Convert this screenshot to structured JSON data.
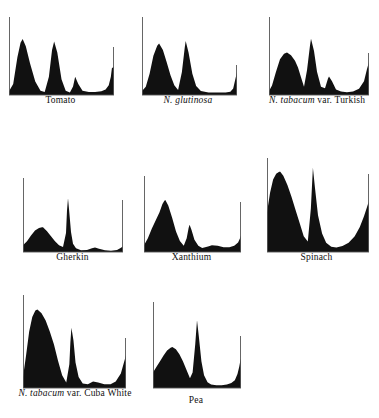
{
  "figure": {
    "type": "densitometer-trace-panel-grid",
    "panel_count": 8,
    "columns": 3,
    "rows": 3,
    "background_color": "#ffffff",
    "trace_color": "#111111",
    "axis_color": "#555555"
  },
  "chart_data": {
    "type": "area",
    "title": "",
    "subtitle": "",
    "xlabel": "",
    "ylabel": "",
    "grid": false,
    "legend_position": "none",
    "axis_ranges": {
      "x": [
        0,
        100
      ],
      "y": [
        0,
        100
      ]
    },
    "panels": [
      {
        "id": "tomato",
        "label": "Tomato",
        "label_italic_prefix": "",
        "label_roman_suffix": "Tomato",
        "peaks": [
          {
            "x": 13,
            "height": 92
          },
          {
            "x": 43,
            "height": 88
          },
          {
            "x": 63,
            "height": 30
          },
          {
            "x": 98,
            "height": 47
          }
        ],
        "x": [
          0,
          4,
          8,
          11,
          13,
          16,
          20,
          25,
          30,
          34,
          38,
          41,
          43,
          46,
          50,
          54,
          58,
          61,
          63,
          66,
          70,
          76,
          82,
          88,
          92,
          95,
          97,
          98,
          100
        ],
        "y": [
          6,
          18,
          62,
          86,
          92,
          80,
          52,
          22,
          7,
          5,
          30,
          74,
          88,
          70,
          26,
          7,
          4,
          14,
          30,
          18,
          7,
          5,
          5,
          6,
          9,
          16,
          30,
          44,
          47
        ]
      },
      {
        "id": "n-glutinosa",
        "label": "N. glutinosa",
        "label_italic_prefix": "N. glutinosa",
        "label_roman_suffix": "",
        "peaks": [
          {
            "x": 18,
            "height": 63
          },
          {
            "x": 46,
            "height": 66
          },
          {
            "x": 100,
            "height": 28
          }
        ],
        "x": [
          0,
          4,
          8,
          12,
          16,
          18,
          22,
          26,
          30,
          34,
          38,
          42,
          45,
          46,
          49,
          53,
          57,
          62,
          70,
          80,
          88,
          93,
          96,
          98,
          100
        ],
        "y": [
          5,
          10,
          26,
          48,
          60,
          63,
          55,
          40,
          24,
          12,
          6,
          28,
          58,
          66,
          52,
          26,
          11,
          5,
          3,
          3,
          3,
          4,
          8,
          18,
          28
        ]
      },
      {
        "id": "n-tabacum-turkish",
        "label": "N. tabacum var. Turkish",
        "label_italic_prefix": "N. tabacum",
        "label_roman_suffix": " var. Turkish",
        "peaks": [
          {
            "x": 18,
            "height": 62
          },
          {
            "x": 42,
            "height": 82
          },
          {
            "x": 60,
            "height": 27
          },
          {
            "x": 100,
            "height": 48
          }
        ],
        "x": [
          0,
          3,
          7,
          11,
          15,
          18,
          22,
          26,
          29,
          32,
          35,
          38,
          41,
          42,
          45,
          48,
          52,
          56,
          59,
          60,
          63,
          67,
          72,
          78,
          84,
          90,
          95,
          98,
          100
        ],
        "y": [
          6,
          14,
          34,
          52,
          60,
          62,
          58,
          50,
          40,
          26,
          12,
          36,
          72,
          82,
          64,
          34,
          12,
          10,
          24,
          27,
          20,
          8,
          5,
          4,
          5,
          9,
          20,
          38,
          48
        ]
      },
      {
        "id": "gherkin",
        "label": "Gherkin",
        "label_italic_prefix": "",
        "label_roman_suffix": "Gherkin",
        "peaks": [
          {
            "x": 20,
            "height": 60
          },
          {
            "x": 45,
            "height": 130
          },
          {
            "x": 72,
            "height": 11
          },
          {
            "x": 100,
            "height": 14
          }
        ],
        "x": [
          0,
          4,
          8,
          12,
          16,
          19,
          20,
          24,
          28,
          32,
          36,
          40,
          43,
          44,
          45,
          46,
          48,
          50,
          53,
          58,
          64,
          69,
          72,
          76,
          82,
          88,
          94,
          98,
          100
        ],
        "y": [
          16,
          26,
          40,
          52,
          58,
          60,
          60,
          50,
          38,
          26,
          16,
          12,
          46,
          100,
          130,
          104,
          48,
          20,
          9,
          4,
          5,
          9,
          11,
          8,
          4,
          3,
          5,
          10,
          14
        ]
      },
      {
        "id": "xanthium",
        "label": "Xanthium",
        "label_italic_prefix": "",
        "label_roman_suffix": "Xanthium",
        "peaks": [
          {
            "x": 22,
            "height": 76
          },
          {
            "x": 47,
            "height": 40
          },
          {
            "x": 70,
            "height": 10
          },
          {
            "x": 100,
            "height": 24
          }
        ],
        "x": [
          0,
          4,
          8,
          12,
          16,
          19,
          21,
          22,
          25,
          29,
          33,
          37,
          41,
          44,
          46,
          47,
          49,
          52,
          56,
          60,
          66,
          70,
          76,
          82,
          88,
          93,
          97,
          99,
          100
        ],
        "y": [
          10,
          20,
          34,
          46,
          58,
          70,
          75,
          76,
          68,
          50,
          30,
          16,
          9,
          20,
          35,
          40,
          32,
          18,
          9,
          6,
          8,
          10,
          9,
          7,
          7,
          9,
          14,
          20,
          24
        ]
      },
      {
        "id": "spinach",
        "label": "Spinach",
        "label_italic_prefix": "",
        "label_roman_suffix": "Spinach",
        "peaks": [
          {
            "x": 13,
            "height": 122
          },
          {
            "x": 45,
            "height": 128
          },
          {
            "x": 100,
            "height": 76
          }
        ],
        "x": [
          0,
          3,
          6,
          9,
          12,
          13,
          16,
          20,
          24,
          28,
          32,
          36,
          40,
          43,
          45,
          47,
          50,
          54,
          58,
          63,
          68,
          74,
          80,
          86,
          91,
          95,
          98,
          99,
          100
        ],
        "y": [
          60,
          90,
          110,
          119,
          122,
          122,
          116,
          102,
          84,
          64,
          44,
          24,
          16,
          66,
          128,
          98,
          56,
          28,
          14,
          8,
          7,
          9,
          14,
          24,
          38,
          54,
          68,
          73,
          76
        ]
      },
      {
        "id": "n-tabacum-cuba-white",
        "label": "N. tabacum var. Cuba White",
        "label_italic_prefix": "N. tabacum",
        "label_roman_suffix": " var. Cuba White",
        "peaks": [
          {
            "x": 14,
            "height": 86
          },
          {
            "x": 47,
            "height": 66
          },
          {
            "x": 68,
            "height": 7
          },
          {
            "x": 100,
            "height": 36
          }
        ],
        "x": [
          0,
          3,
          6,
          9,
          12,
          14,
          18,
          22,
          26,
          30,
          34,
          38,
          42,
          45,
          46,
          47,
          49,
          51,
          54,
          58,
          63,
          68,
          73,
          79,
          85,
          90,
          95,
          98,
          100
        ],
        "y": [
          12,
          36,
          62,
          78,
          85,
          86,
          82,
          74,
          62,
          48,
          30,
          14,
          6,
          26,
          50,
          66,
          52,
          28,
          12,
          5,
          4,
          7,
          6,
          4,
          4,
          7,
          16,
          28,
          36
        ]
      },
      {
        "id": "pea",
        "label": "Pea",
        "label_italic_prefix": "",
        "label_roman_suffix": "Pea",
        "peaks": [
          {
            "x": 22,
            "height": 58
          },
          {
            "x": 50,
            "height": 96
          },
          {
            "x": 100,
            "height": 42
          }
        ],
        "x": [
          0,
          4,
          8,
          12,
          16,
          20,
          22,
          26,
          30,
          34,
          38,
          42,
          45,
          48,
          50,
          52,
          55,
          58,
          62,
          66,
          72,
          78,
          84,
          89,
          93,
          96,
          98,
          99,
          100
        ],
        "y": [
          22,
          30,
          38,
          46,
          53,
          57,
          58,
          55,
          48,
          38,
          26,
          14,
          22,
          62,
          96,
          74,
          38,
          18,
          8,
          5,
          4,
          4,
          5,
          7,
          11,
          20,
          30,
          37,
          42
        ]
      }
    ]
  }
}
